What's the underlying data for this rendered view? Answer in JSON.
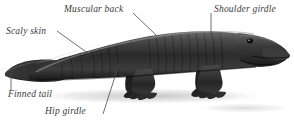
{
  "figure": {
    "background_color": "#ffffff",
    "label_color": "#3a3a3a",
    "leader_color": "#4a4a4a",
    "body_color_dark": "#1c1c1c",
    "body_color_mid": "#555555",
    "body_color_light": "#8d8d8d",
    "shadow_color": "#c9c9c9"
  },
  "labels": {
    "scaly_skin": "Scaly skin",
    "muscular_back": "Muscular back",
    "shoulder_girdle": "Shoulder girdle",
    "finned_tail": "Finned tail",
    "hip_girdle": "Hip girdle"
  }
}
